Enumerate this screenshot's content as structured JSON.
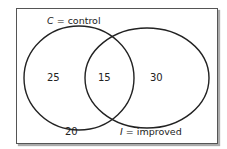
{
  "diagram": {
    "type": "venn",
    "sets": [
      {
        "symbol": "C",
        "eq": " = ",
        "name": "control"
      },
      {
        "symbol": "I",
        "eq": " = ",
        "name": "improved"
      }
    ],
    "regions": {
      "only_c": "25",
      "both": "15",
      "only_i": "30",
      "neither": "20"
    },
    "colors": {
      "stroke": "#222222",
      "frame": "#555555",
      "background": "#ffffff"
    }
  }
}
